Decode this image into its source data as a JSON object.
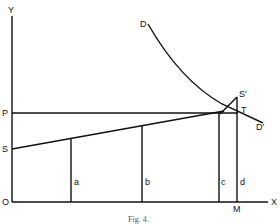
{
  "figure": {
    "caption": "Fig. 4.",
    "axes": {
      "y_label": "Y",
      "x_label": "X",
      "origin_label": "O"
    },
    "points": {
      "P": "P",
      "S": "S",
      "D": "D",
      "D_prime": "D'",
      "S_prime": "S'",
      "T": "T",
      "M": "M"
    },
    "verticals": [
      "a",
      "b",
      "c",
      "d"
    ],
    "colors": {
      "ink": "#111111",
      "background": "#ffffff"
    }
  }
}
